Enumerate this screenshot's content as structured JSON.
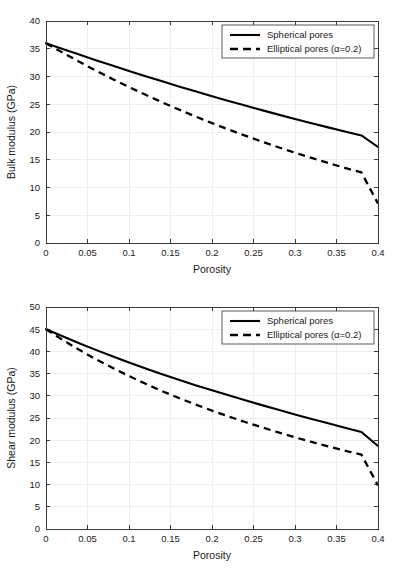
{
  "figure": {
    "background_color": "#ffffff",
    "panel_count": 2
  },
  "chart_data": [
    {
      "type": "line",
      "title": "",
      "xlabel": "Porosity",
      "ylabel": "Bulk modulus (GPa)",
      "xlim": [
        0,
        0.4
      ],
      "ylim": [
        0,
        40
      ],
      "grid": true,
      "legend_position": "top-right",
      "xticks": [
        0,
        0.05,
        0.1,
        0.15,
        0.2,
        0.25,
        0.3,
        0.35,
        0.4
      ],
      "xtick_labels": [
        "0",
        "0.05",
        "0.1",
        "0.15",
        "0.2",
        "0.25",
        "0.3",
        "0.35",
        "0.4"
      ],
      "yticks": [
        0,
        5,
        10,
        15,
        20,
        25,
        30,
        35,
        40
      ],
      "ytick_labels": [
        "0",
        "5",
        "10",
        "15",
        "20",
        "25",
        "30",
        "35",
        "40"
      ],
      "x": [
        0,
        0.02,
        0.04,
        0.06,
        0.08,
        0.1,
        0.12,
        0.14,
        0.16,
        0.18,
        0.2,
        0.22,
        0.24,
        0.26,
        0.28,
        0.3,
        0.32,
        0.34,
        0.36,
        0.38,
        0.4
      ],
      "series": [
        {
          "name": "Spherical pores",
          "style": "solid",
          "color": "#000000",
          "values": [
            36.0,
            34.97,
            33.95,
            32.95,
            31.97,
            31.0,
            30.06,
            29.13,
            28.22,
            27.33,
            26.45,
            25.6,
            24.76,
            23.94,
            23.13,
            22.35,
            21.58,
            20.83,
            20.1,
            19.38,
            17.3
          ]
        },
        {
          "name": "Elliptical pores (α=0.2)",
          "style": "dashed",
          "color": "#000000",
          "values": [
            36.0,
            34.3,
            32.66,
            31.08,
            29.56,
            28.1,
            26.7,
            25.35,
            24.05,
            22.8,
            21.6,
            20.45,
            19.34,
            18.27,
            17.25,
            16.27,
            15.33,
            14.42,
            13.55,
            12.71,
            7.1
          ]
        }
      ]
    },
    {
      "type": "line",
      "title": "",
      "xlabel": "Porosity",
      "ylabel": "Shear modulus (GPa)",
      "xlim": [
        0,
        0.4
      ],
      "ylim": [
        0,
        50
      ],
      "grid": true,
      "legend_position": "top-right",
      "xticks": [
        0,
        0.05,
        0.1,
        0.15,
        0.2,
        0.25,
        0.3,
        0.35,
        0.4
      ],
      "xtick_labels": [
        "0",
        "0.05",
        "0.1",
        "0.15",
        "0.2",
        "0.25",
        "0.3",
        "0.35",
        "0.4"
      ],
      "yticks": [
        0,
        5,
        10,
        15,
        20,
        25,
        30,
        35,
        40,
        45,
        50
      ],
      "ytick_labels": [
        "0",
        "5",
        "10",
        "15",
        "20",
        "25",
        "30",
        "35",
        "40",
        "45",
        "50"
      ],
      "x": [
        0,
        0.02,
        0.04,
        0.06,
        0.08,
        0.1,
        0.12,
        0.14,
        0.16,
        0.18,
        0.2,
        0.22,
        0.24,
        0.26,
        0.28,
        0.3,
        0.32,
        0.34,
        0.36,
        0.38,
        0.4
      ],
      "series": [
        {
          "name": "Spherical pores",
          "style": "solid",
          "color": "#000000",
          "values": [
            45.0,
            43.4,
            41.85,
            40.35,
            38.9,
            37.5,
            36.15,
            34.85,
            33.6,
            32.4,
            31.25,
            30.1,
            29.0,
            27.9,
            26.85,
            25.8,
            24.8,
            23.8,
            22.8,
            21.85,
            18.7
          ]
        },
        {
          "name": "Elliptical pores (α=0.2)",
          "style": "dashed",
          "color": "#000000",
          "values": [
            45.0,
            42.6,
            40.35,
            38.25,
            36.3,
            34.45,
            32.7,
            31.05,
            29.5,
            28.05,
            26.65,
            25.35,
            24.1,
            22.9,
            21.75,
            20.65,
            19.6,
            18.6,
            17.65,
            16.75,
            9.8
          ]
        }
      ]
    }
  ]
}
